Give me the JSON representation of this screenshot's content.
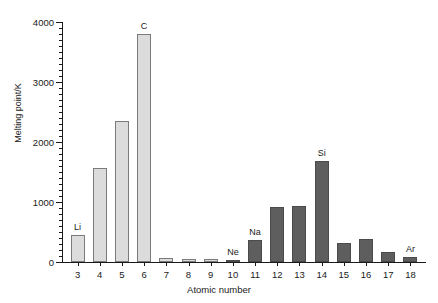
{
  "chart_data": {
    "type": "bar",
    "title": "",
    "xlabel": "Atomic number",
    "ylabel": "Melting point/K",
    "xlim": [
      2.3,
      18.7
    ],
    "ylim": [
      0,
      4000
    ],
    "grid": false,
    "legend": null,
    "ytick_labels": [
      "0",
      "1000",
      "2000",
      "3000",
      "4000"
    ],
    "ytick_values": [
      0,
      1000,
      2000,
      3000,
      4000
    ],
    "yminor_step": 100,
    "categories": [
      "3",
      "4",
      "5",
      "6",
      "7",
      "8",
      "9",
      "10",
      "11",
      "12",
      "13",
      "14",
      "15",
      "16",
      "17",
      "18"
    ],
    "values": [
      454,
      1560,
      2349,
      3800,
      63,
      54,
      53,
      25,
      371,
      923,
      933,
      1687,
      317,
      388,
      172,
      84
    ],
    "bar_colors": [
      "#dcdcdc",
      "#dcdcdc",
      "#dcdcdc",
      "#dcdcdc",
      "#dcdcdc",
      "#dcdcdc",
      "#dcdcdc",
      "#5e5e5e",
      "#5e5e5e",
      "#5e5e5e",
      "#5e5e5e",
      "#5e5e5e",
      "#5e5e5e",
      "#5e5e5e",
      "#5e5e5e",
      "#5e5e5e"
    ],
    "annotations": [
      {
        "category": "3",
        "label": "Li"
      },
      {
        "category": "6",
        "label": "C"
      },
      {
        "category": "10",
        "label": "Ne"
      },
      {
        "category": "11",
        "label": "Na"
      },
      {
        "category": "14",
        "label": "Si"
      },
      {
        "category": "18",
        "label": "Ar"
      }
    ],
    "colors": {
      "period2_bar": "#dcdcdc",
      "period3_bar": "#5e5e5e",
      "axis": "#1a1a1a",
      "background": "#ffffff"
    }
  }
}
